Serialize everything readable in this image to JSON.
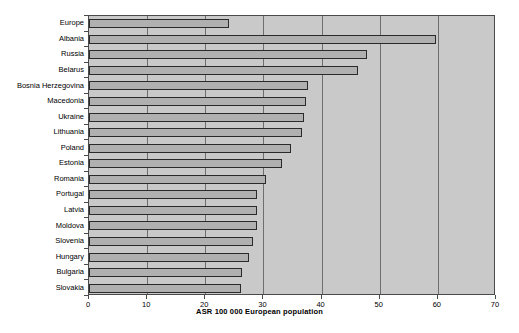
{
  "chart_data": {
    "type": "bar",
    "orientation": "horizontal",
    "title": "",
    "subtitle": "",
    "xlabel": "ASR 100 000 European population",
    "ylabel": "",
    "xlim": [
      0,
      70
    ],
    "xticks": [
      0,
      10,
      20,
      30,
      40,
      50,
      60,
      70
    ],
    "xticklabels": [
      "0",
      "10",
      "20",
      "30",
      "40",
      "50",
      "60",
      "70"
    ],
    "grid": true,
    "grid_axis": "x",
    "legend": false,
    "legend_position": "none",
    "categories": [
      "Europe",
      "Albania",
      "Russia",
      "Belarus",
      "Bosnia Herzegovina",
      "Macedonia",
      "Ukraine",
      "Lithuania",
      "Poland",
      "Estonia",
      "Romania",
      "Portugal",
      "Latvia",
      "Moldova",
      "Slovenia",
      "Hungary",
      "Bulgaria",
      "Slovakia"
    ],
    "values": [
      24.1,
      59.7,
      47.8,
      46.3,
      37.7,
      37.3,
      37.0,
      36.7,
      34.8,
      33.2,
      30.5,
      28.9,
      28.9,
      28.9,
      28.2,
      27.5,
      26.3,
      26.2
    ],
    "colors": {
      "bar_fill": "#b0b0b0",
      "bar_edge": "#2a2a2a",
      "plot_background": "#c9c9c9",
      "gridline": "#6e6e6e",
      "frame": "#4a4a4a",
      "page_background": "#ffffff",
      "text": "#000000"
    }
  }
}
